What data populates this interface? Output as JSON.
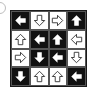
{
  "option_marker": {
    "shape": "circle",
    "partial": true
  },
  "grid": {
    "rows": 4,
    "cols": 4,
    "colors": {
      "black": "#111111",
      "white": "#ffffff",
      "outline": "#333333"
    },
    "cells": [
      [
        {
          "bg": "black",
          "arrow": "left",
          "style": "solid"
        },
        {
          "bg": "white",
          "arrow": "down",
          "style": "outline"
        },
        {
          "bg": "white",
          "arrow": "right",
          "style": "outline"
        },
        {
          "bg": "black",
          "arrow": "up",
          "style": "solid"
        }
      ],
      [
        {
          "bg": "white",
          "arrow": "up",
          "style": "outline"
        },
        {
          "bg": "black",
          "arrow": "left",
          "style": "solid"
        },
        {
          "bg": "black",
          "arrow": "up",
          "style": "solid"
        },
        {
          "bg": "white",
          "arrow": "left",
          "style": "outline"
        }
      ],
      [
        {
          "bg": "white",
          "arrow": "right",
          "style": "outline"
        },
        {
          "bg": "black",
          "arrow": "down",
          "style": "solid"
        },
        {
          "bg": "black",
          "arrow": "left",
          "style": "solid"
        },
        {
          "bg": "white",
          "arrow": "down",
          "style": "outline"
        }
      ],
      [
        {
          "bg": "black",
          "arrow": "down",
          "style": "solid"
        },
        {
          "bg": "white",
          "arrow": "up",
          "style": "outline"
        },
        {
          "bg": "white",
          "arrow": "up",
          "style": "outline"
        },
        {
          "bg": "black",
          "arrow": "left",
          "style": "solid"
        }
      ]
    ]
  }
}
